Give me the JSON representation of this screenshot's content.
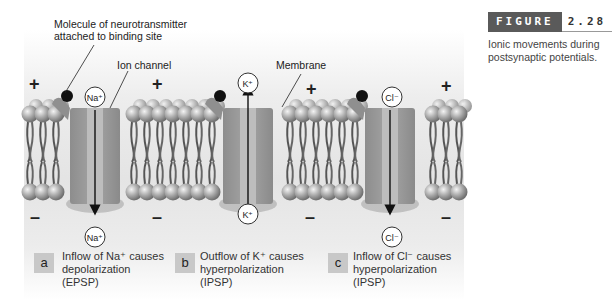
{
  "figure": {
    "label_word": "FIGURE",
    "label_number": "2.28",
    "description_lines": [
      "Ionic movements during",
      "postsynaptic potentials."
    ]
  },
  "callouts": {
    "neurotransmitter": [
      "Molecule of neurotransmitter",
      "attached to binding site"
    ],
    "ion_channel": "Ion channel",
    "membrane": "Membrane"
  },
  "signs": {
    "plus": "+",
    "minus": "–"
  },
  "panels": [
    {
      "letter": "a",
      "ion": "Na⁺",
      "direction": "inflow",
      "caption": [
        "Inflow of Na⁺ causes",
        "depolarization",
        "(EPSP)"
      ]
    },
    {
      "letter": "b",
      "ion": "K⁺",
      "direction": "outflow",
      "caption": [
        "Outflow of K⁺ causes",
        "hyperpolarization",
        "(IPSP)"
      ]
    },
    {
      "letter": "c",
      "ion": "Cl⁻",
      "direction": "inflow",
      "caption": [
        "Inflow of Cl⁻ causes",
        "hyperpolarization",
        "(IPSP)"
      ]
    }
  ],
  "colors": {
    "figure_label_bg": "#5a5a5a",
    "badge_bg": "#c8c8c8"
  }
}
